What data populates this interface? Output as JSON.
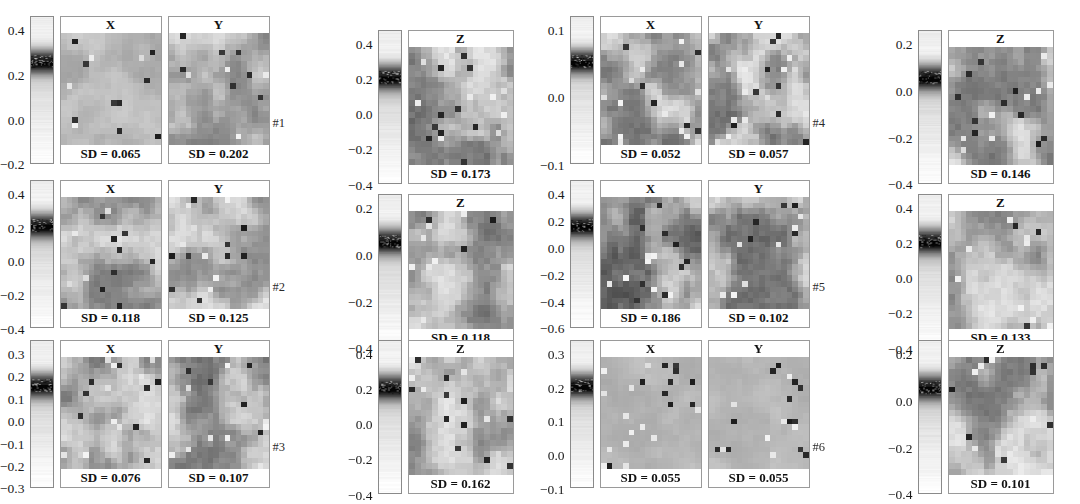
{
  "figure": {
    "type": "image-panel-grid",
    "panel_titles": [
      "X",
      "Y",
      "Z"
    ],
    "sd_prefix": "SD = ",
    "groups": [
      {
        "id": "#1",
        "row": 0,
        "col": 0,
        "colorbar_ticks": [
          "0.4",
          "0.2",
          "0.0",
          "−0.2"
        ],
        "colorbar_range": [
          -0.32,
          0.52
        ],
        "panels": [
          {
            "title": "X",
            "sd": "SD = 0.065",
            "sd_value": 0.065,
            "seed": 11,
            "contrast": 0.3,
            "base": 184
          },
          {
            "title": "Y",
            "sd": "SD = 0.202",
            "sd_value": 0.202,
            "seed": 12,
            "contrast": 0.62,
            "base": 176
          }
        ],
        "z_ticks": [
          "0.4",
          "0.2",
          "0.0",
          "−0.2",
          "−0.4"
        ],
        "z_panel": {
          "title": "Z",
          "sd": "SD = 0.173",
          "sd_value": 0.173,
          "seed": 13,
          "contrast": 0.85,
          "base": 170
        }
      },
      {
        "id": "#2",
        "row": 1,
        "col": 0,
        "colorbar_ticks": [
          "0.4",
          "0.2",
          "0.0",
          "−0.2",
          "−0.4"
        ],
        "colorbar_range": [
          -0.52,
          0.52
        ],
        "panels": [
          {
            "title": "X",
            "sd": "SD = 0.118",
            "sd_value": 0.118,
            "seed": 21,
            "contrast": 0.7,
            "base": 176
          },
          {
            "title": "Y",
            "sd": "SD = 0.125",
            "sd_value": 0.125,
            "seed": 22,
            "contrast": 0.66,
            "base": 178
          }
        ],
        "z_ticks": [
          "0.2",
          "0.0",
          "−0.2",
          "−0.4"
        ],
        "z_panel": {
          "title": "Z",
          "sd": "SD = 0.118",
          "sd_value": 0.118,
          "seed": 23,
          "contrast": 0.78,
          "base": 168
        }
      },
      {
        "id": "#3",
        "row": 2,
        "col": 0,
        "colorbar_ticks": [
          "0.3",
          "0.2",
          "0.1",
          "0.0",
          "−0.1",
          "−0.2",
          "−0.3"
        ],
        "colorbar_range": [
          -0.33,
          0.33
        ],
        "panels": [
          {
            "title": "X",
            "sd": "SD = 0.076",
            "sd_value": 0.076,
            "seed": 31,
            "contrast": 0.74,
            "base": 170
          },
          {
            "title": "Y",
            "sd": "SD = 0.107",
            "sd_value": 0.107,
            "seed": 32,
            "contrast": 0.8,
            "base": 168
          }
        ],
        "z_ticks": [
          "0.4",
          "0.2",
          "0.0",
          "−0.2",
          "−0.4"
        ],
        "z_panel": {
          "title": "Z",
          "sd": "SD = 0.162",
          "sd_value": 0.162,
          "seed": 33,
          "contrast": 0.72,
          "base": 178
        }
      },
      {
        "id": "#4",
        "row": 0,
        "col": 1,
        "colorbar_ticks": [
          "0.1",
          "0.0",
          "−0.1"
        ],
        "colorbar_range": [
          -0.16,
          0.15
        ],
        "panels": [
          {
            "title": "X",
            "sd": "SD = 0.052",
            "sd_value": 0.052,
            "seed": 41,
            "contrast": 0.82,
            "base": 172
          },
          {
            "title": "Y",
            "sd": "SD = 0.057",
            "sd_value": 0.057,
            "seed": 42,
            "contrast": 0.86,
            "base": 168
          }
        ],
        "z_ticks": [
          "0.2",
          "0.0",
          "−0.2",
          "−0.4"
        ],
        "z_panel": {
          "title": "Z",
          "sd": "SD = 0.146",
          "sd_value": 0.146,
          "seed": 43,
          "contrast": 0.76,
          "base": 172
        }
      },
      {
        "id": "#5",
        "row": 1,
        "col": 1,
        "colorbar_ticks": [
          "0.4",
          "0.2",
          "0.0",
          "−0.2",
          "−0.4",
          "−0.6"
        ],
        "colorbar_range": [
          -0.66,
          0.52
        ],
        "panels": [
          {
            "title": "X",
            "sd": "SD = 0.186",
            "sd_value": 0.186,
            "seed": 51,
            "contrast": 0.92,
            "base": 150
          },
          {
            "title": "Y",
            "sd": "SD = 0.102",
            "sd_value": 0.102,
            "seed": 52,
            "contrast": 0.84,
            "base": 168
          }
        ],
        "z_ticks": [
          "0.4",
          "0.2",
          "0.0",
          "−0.2",
          "−0.4"
        ],
        "z_panel": {
          "title": "Z",
          "sd": "SD = 0.133",
          "sd_value": 0.133,
          "seed": 53,
          "contrast": 0.7,
          "base": 176
        }
      },
      {
        "id": "#6",
        "row": 2,
        "col": 1,
        "colorbar_ticks": [
          "0.3",
          "0.2",
          "0.1",
          "0.0",
          "−0.1"
        ],
        "colorbar_range": [
          -0.14,
          0.33
        ],
        "panels": [
          {
            "title": "X",
            "sd": "SD = 0.055",
            "sd_value": 0.055,
            "seed": 61,
            "contrast": 0.18,
            "base": 184
          },
          {
            "title": "Y",
            "sd": "SD = 0.055",
            "sd_value": 0.055,
            "seed": 62,
            "contrast": 0.16,
            "base": 185
          }
        ],
        "z_ticks": [
          "0.2",
          "0.0",
          "−0.2",
          "−0.4"
        ],
        "z_panel": {
          "title": "Z",
          "sd": "SD = 0.101",
          "sd_value": 0.101,
          "seed": 63,
          "contrast": 0.8,
          "base": 172
        }
      }
    ]
  },
  "chart_data": {
    "type": "heatmap",
    "title": "",
    "panel_columns": [
      "X",
      "Y",
      "Z"
    ],
    "specimens": [
      "#1",
      "#2",
      "#3",
      "#4",
      "#5",
      "#6"
    ],
    "series": [
      {
        "name": "#1",
        "categories": [
          "X",
          "Y",
          "Z"
        ],
        "values": [
          0.065,
          0.202,
          0.173
        ],
        "colorbar_ticks_xy": [
          0.4,
          0.2,
          0.0,
          -0.2
        ],
        "colorbar_ticks_z": [
          0.4,
          0.2,
          0.0,
          -0.2,
          -0.4
        ]
      },
      {
        "name": "#2",
        "categories": [
          "X",
          "Y",
          "Z"
        ],
        "values": [
          0.118,
          0.125,
          0.118
        ],
        "colorbar_ticks_xy": [
          0.4,
          0.2,
          0.0,
          -0.2,
          -0.4
        ],
        "colorbar_ticks_z": [
          0.2,
          0.0,
          -0.2,
          -0.4
        ]
      },
      {
        "name": "#3",
        "categories": [
          "X",
          "Y",
          "Z"
        ],
        "values": [
          0.076,
          0.107,
          0.162
        ],
        "colorbar_ticks_xy": [
          0.3,
          0.2,
          0.1,
          0.0,
          -0.1,
          -0.2,
          -0.3
        ],
        "colorbar_ticks_z": [
          0.4,
          0.2,
          0.0,
          -0.2,
          -0.4
        ]
      },
      {
        "name": "#4",
        "categories": [
          "X",
          "Y",
          "Z"
        ],
        "values": [
          0.052,
          0.057,
          0.146
        ],
        "colorbar_ticks_xy": [
          0.1,
          0.0,
          -0.1
        ],
        "colorbar_ticks_z": [
          0.2,
          0.0,
          -0.2,
          -0.4
        ]
      },
      {
        "name": "#5",
        "categories": [
          "X",
          "Y",
          "Z"
        ],
        "values": [
          0.186,
          0.102,
          0.133
        ],
        "colorbar_ticks_xy": [
          0.4,
          0.2,
          0.0,
          -0.2,
          -0.4,
          -0.6
        ],
        "colorbar_ticks_z": [
          0.4,
          0.2,
          0.0,
          -0.2,
          -0.4
        ]
      },
      {
        "name": "#6",
        "categories": [
          "X",
          "Y",
          "Z"
        ],
        "values": [
          0.055,
          0.055,
          0.101
        ],
        "colorbar_ticks_xy": [
          0.3,
          0.2,
          0.1,
          0.0,
          -0.1
        ],
        "colorbar_ticks_z": [
          0.2,
          0.0,
          -0.2,
          -0.4
        ]
      }
    ],
    "value_label": "SD",
    "colormap": "grayscale",
    "legend": "vertical colorbar per group",
    "grid": false
  }
}
